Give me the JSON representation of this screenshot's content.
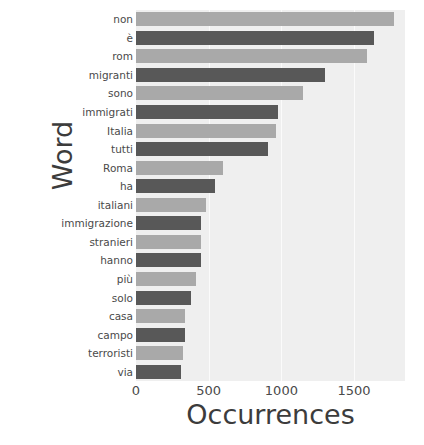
{
  "chart_data": {
    "type": "bar",
    "orientation": "horizontal",
    "title": "",
    "xlabel": "Occurrences",
    "ylabel": "Word",
    "xlim": [
      0,
      1850
    ],
    "xticks": [
      0,
      500,
      1000,
      1500
    ],
    "xticklabels": [
      "0",
      "500",
      "1000",
      "1500"
    ],
    "grid": true,
    "grid_axis": "x",
    "legend": "none",
    "categories": [
      "non",
      "è",
      "rom",
      "migranti",
      "sono",
      "immigrati",
      "Italia",
      "tutti",
      "Roma",
      "ha",
      "italiani",
      "immigrazione",
      "stranieri",
      "hanno",
      "più",
      "solo",
      "casa",
      "campo",
      "terroristi",
      "via"
    ],
    "values": [
      1775,
      1640,
      1590,
      1300,
      1150,
      980,
      965,
      910,
      600,
      545,
      480,
      450,
      445,
      450,
      415,
      375,
      340,
      335,
      320,
      310
    ],
    "bar_colors": [
      "#a9a9a9",
      "#585858",
      "#a9a9a9",
      "#585858",
      "#a9a9a9",
      "#585858",
      "#a9a9a9",
      "#585858",
      "#a9a9a9",
      "#585858",
      "#a9a9a9",
      "#585858",
      "#a9a9a9",
      "#585858",
      "#a9a9a9",
      "#585858",
      "#a9a9a9",
      "#585858",
      "#a9a9a9",
      "#585858"
    ],
    "plot_background": "#efefef",
    "gridline_color": "#fbfbfb",
    "text_color": "#4a4a4a"
  }
}
